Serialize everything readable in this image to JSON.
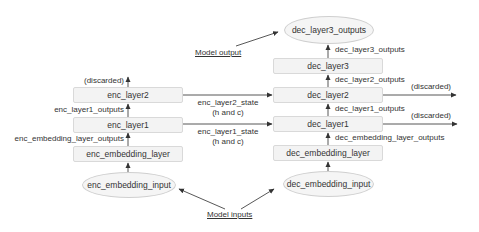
{
  "encoder": {
    "layers": [
      {
        "id": "enc_layer2",
        "label": "enc_layer2"
      },
      {
        "id": "enc_layer1",
        "label": "enc_layer1"
      },
      {
        "id": "enc_embedding_layer",
        "label": "enc_embedding_layer"
      }
    ],
    "input": {
      "label": "enc_embedding_input"
    },
    "edge_labels": {
      "layer2_out": "(discarded)",
      "layer1_out": "enc_layer1_outputs",
      "embedding_out": "enc_embedding_layer_outputs"
    }
  },
  "decoder": {
    "layers": [
      {
        "id": "dec_layer3",
        "label": "dec_layer3"
      },
      {
        "id": "dec_layer2",
        "label": "dec_layer2"
      },
      {
        "id": "dec_layer1",
        "label": "dec_layer1"
      },
      {
        "id": "dec_embedding_layer",
        "label": "dec_embedding_layer"
      }
    ],
    "input": {
      "label": "dec_embedding_input"
    },
    "output": {
      "label": "dec_layer3_outputs"
    },
    "edge_labels": {
      "layer3_out": "dec_layer3_outputs",
      "layer2_out": "dec_layer2_outputs",
      "layer1_out": "dec_layer1_outputs",
      "embedding_out": "dec_embedding_layer_outputs",
      "layer2_discard": "(discarded)",
      "layer1_discard": "(discarded)"
    }
  },
  "states": {
    "layer2": {
      "line1": "enc_layer2_state",
      "line2": "(h and c)"
    },
    "layer1": {
      "line1": "enc_layer1_state",
      "line2": "(h and c)"
    }
  },
  "annotations": {
    "model_output": "Model output",
    "model_inputs": "Model inputs"
  },
  "colors": {
    "box_fill": "#f3f3f3",
    "box_border": "#d9d9d9",
    "line": "#333333",
    "text": "#333333"
  }
}
